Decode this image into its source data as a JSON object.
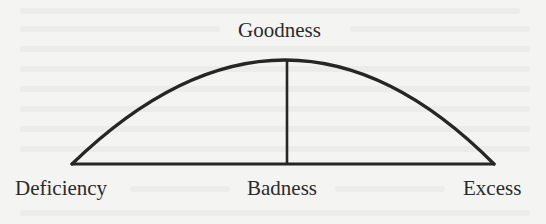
{
  "diagram": {
    "type": "arc-mean-diagram",
    "labels": {
      "top": "Goodness",
      "bottom_left": "Deficiency",
      "bottom_center": "Badness",
      "bottom_right": "Excess"
    },
    "geometry": {
      "baseline": {
        "x1": 72,
        "y1": 164,
        "x2": 494,
        "y2": 164
      },
      "arc": {
        "start": [
          72,
          164
        ],
        "apex": [
          287,
          60
        ],
        "end": [
          494,
          164
        ]
      },
      "vertical": {
        "x": 287,
        "y1": 60,
        "y2": 164
      }
    },
    "colors": {
      "stroke": "#262626",
      "background": "#f4f4f2",
      "text": "#2b2b2b"
    }
  }
}
